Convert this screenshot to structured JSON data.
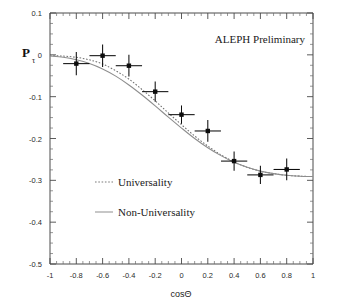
{
  "chart_data": {
    "type": "scatter",
    "title": "ALEPH Preliminary",
    "xlabel": "cosΘ",
    "ylabel": "P",
    "ylabel_sub": "τ",
    "xlim": [
      -1,
      1
    ],
    "ylim": [
      -0.5,
      0.1
    ],
    "grid": false,
    "xticks": [
      -1,
      -0.8,
      -0.6,
      -0.4,
      -0.2,
      0,
      0.2,
      0.4,
      0.6,
      0.8,
      1
    ],
    "xticklabels": [
      "-1",
      "-0.8",
      "-0.6",
      "-0.4",
      "-0.2",
      "0",
      "0.2",
      "0.4",
      "0.6",
      "0.8",
      "1"
    ],
    "yticks": [
      0.1,
      0,
      -0.1,
      -0.2,
      -0.3,
      -0.4,
      -0.5
    ],
    "yticklabels": [
      "0.1",
      "0",
      "-0.1",
      "-0.2",
      "-0.3",
      "-0.4",
      "-0.5"
    ],
    "legend_position": "center-left",
    "series": [
      {
        "name": "data-points",
        "type": "scatter",
        "marker": "square",
        "x": [
          -0.8,
          -0.6,
          -0.4,
          -0.2,
          0.0,
          0.2,
          0.4,
          0.6,
          0.8
        ],
        "y": [
          -0.021,
          -0.002,
          -0.026,
          -0.088,
          -0.143,
          -0.182,
          -0.254,
          -0.287,
          -0.274
        ],
        "yerr": [
          0.028,
          0.027,
          0.026,
          0.024,
          0.022,
          0.026,
          0.023,
          0.022,
          0.026
        ],
        "xerr": [
          0.1,
          0.1,
          0.1,
          0.1,
          0.1,
          0.1,
          0.1,
          0.1,
          0.1
        ]
      },
      {
        "name": "Universality",
        "type": "line",
        "style": "dotted",
        "x": [
          -1.0,
          -0.9,
          -0.8,
          -0.7,
          -0.6,
          -0.5,
          -0.4,
          -0.3,
          -0.2,
          -0.1,
          0.0,
          0.1,
          0.2,
          0.3,
          0.4,
          0.5,
          0.6,
          0.7,
          0.8,
          0.9,
          1.0
        ],
        "y": [
          -0.002,
          -0.003,
          -0.006,
          -0.012,
          -0.022,
          -0.038,
          -0.058,
          -0.083,
          -0.11,
          -0.139,
          -0.167,
          -0.194,
          -0.218,
          -0.239,
          -0.256,
          -0.269,
          -0.278,
          -0.284,
          -0.288,
          -0.29,
          -0.291
        ]
      },
      {
        "name": "Non-Universality",
        "type": "line",
        "style": "solid",
        "x": [
          -1.0,
          -0.9,
          -0.8,
          -0.7,
          -0.6,
          -0.5,
          -0.4,
          -0.3,
          -0.2,
          -0.1,
          0.0,
          0.1,
          0.2,
          0.3,
          0.4,
          0.5,
          0.6,
          0.7,
          0.8,
          0.9,
          1.0
        ],
        "y": [
          -0.003,
          -0.006,
          -0.012,
          -0.021,
          -0.034,
          -0.051,
          -0.072,
          -0.096,
          -0.122,
          -0.149,
          -0.175,
          -0.2,
          -0.222,
          -0.241,
          -0.257,
          -0.269,
          -0.278,
          -0.284,
          -0.288,
          -0.29,
          -0.291
        ]
      }
    ],
    "legend": [
      {
        "label": "Universality",
        "style": "dotted"
      },
      {
        "label": "Non-Universality",
        "style": "solid"
      }
    ]
  }
}
